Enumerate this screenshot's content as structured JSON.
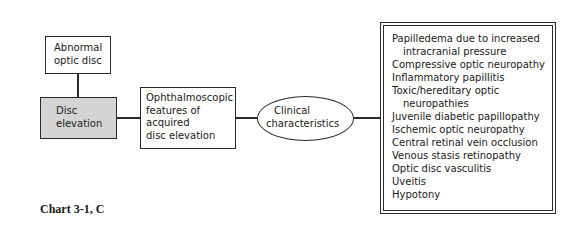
{
  "diagram": {
    "nodes": {
      "abnormal": {
        "lines": [
          "Abnormal",
          "optic disc"
        ]
      },
      "disc": {
        "lines": [
          "Disc",
          "elevation"
        ]
      },
      "ophth": {
        "lines": [
          "Ophthalmoscopic",
          "features  of",
          "acquired",
          "disc elevation"
        ]
      },
      "clinical": {
        "lines": [
          "Clinical",
          "characteristics"
        ]
      }
    },
    "list": {
      "items": [
        {
          "text": "Papilledema due to increased",
          "cont": "intracranial pressure"
        },
        {
          "text": "Compressive optic neuropathy"
        },
        {
          "text": "Inflammatory papillitis"
        },
        {
          "text": "Toxic/hereditary optic",
          "cont": "neuropathies"
        },
        {
          "text": "Juvenile diabetic papillopathy"
        },
        {
          "text": "Ischemic optic neuropathy"
        },
        {
          "text": "Central retinal vein occlusion"
        },
        {
          "text": "Venous stasis retinopathy"
        },
        {
          "text": "Optic disc vasculitis"
        },
        {
          "text": "Uveitis"
        },
        {
          "text": "Hypotony"
        }
      ]
    },
    "edges": [
      [
        "Abnormal optic disc",
        "Disc elevation"
      ],
      [
        "Disc elevation",
        "Ophthalmoscopic features of acquired disc elevation"
      ],
      [
        "Ophthalmoscopic features of acquired disc elevation",
        "Clinical characteristics"
      ],
      [
        "Clinical characteristics",
        "Causes list"
      ]
    ],
    "colors": {
      "disc_fill": "#d4d4d4",
      "stroke": "#2a2a2a"
    }
  },
  "caption": "Chart 3-1, C"
}
